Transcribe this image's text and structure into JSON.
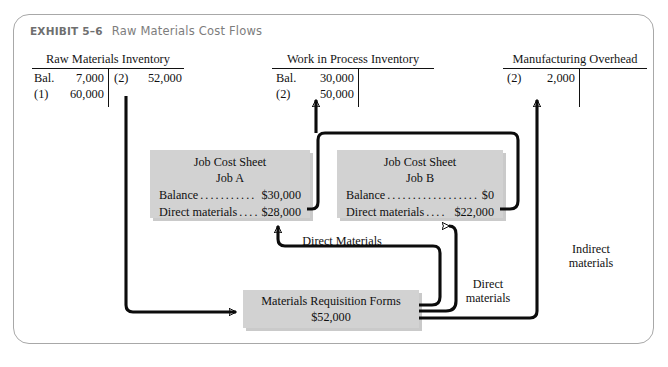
{
  "exhibit": {
    "number": "EXHIBIT 5–6",
    "title": "Raw Materials Cost Flows"
  },
  "t_accounts": [
    {
      "name": "raw-materials-inventory",
      "title": "Raw Materials Inventory",
      "debits": [
        {
          "ref": "Bal.",
          "amount": "7,000"
        },
        {
          "ref": "(1)",
          "amount": "60,000"
        }
      ],
      "credits": [
        {
          "ref": "(2)",
          "amount": "52,000"
        }
      ]
    },
    {
      "name": "work-in-process-inventory",
      "title": "Work in Process Inventory",
      "debits": [
        {
          "ref": "Bal.",
          "amount": "30,000"
        },
        {
          "ref": "(2)",
          "amount": "50,000"
        }
      ],
      "credits": []
    },
    {
      "name": "manufacturing-overhead",
      "title": "Manufacturing Overhead",
      "debits": [
        {
          "ref": "(2)",
          "amount": "2,000"
        }
      ],
      "credits": []
    }
  ],
  "job_cost_sheets": [
    {
      "name": "job-cost-sheet-a",
      "title": "Job Cost Sheet",
      "job": "Job A",
      "rows": [
        {
          "label": "Balance",
          "value": "$30,000"
        },
        {
          "label": "Direct materials",
          "value": "$28,000"
        }
      ]
    },
    {
      "name": "job-cost-sheet-b",
      "title": "Job Cost Sheet",
      "job": "Job B",
      "rows": [
        {
          "label": "Balance",
          "value": "$0"
        },
        {
          "label": "Direct materials",
          "value": "$22,000"
        }
      ]
    }
  ],
  "requisition_box": {
    "title": "Materials Requisition Forms",
    "amount": "$52,000"
  },
  "flow_labels": {
    "direct_materials_center": "Direct Materials",
    "direct_materials_right_line1": "Direct",
    "direct_materials_right_line2": "materials",
    "indirect_materials_line1": "Indirect",
    "indirect_materials_line2": "materials"
  },
  "colors": {
    "frame_border": "#a8a8a8",
    "box_fill": "#d2d2d2",
    "ink": "#0c0c0c",
    "header_gray": "#7d7d7d"
  }
}
